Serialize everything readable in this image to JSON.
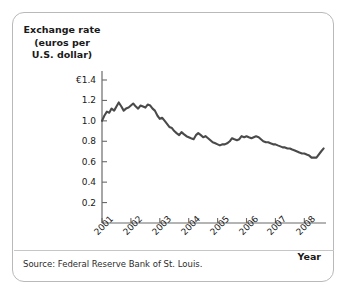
{
  "figure": {
    "source_note": "Source: Federal Reserve Bank of St. Louis.",
    "border_color": "#b9b9b9",
    "background_color": "#ffffff"
  },
  "chart_data": {
    "type": "line",
    "title": "",
    "ylabel": "Exchange rate\n(euros per\nU.S. dollar)",
    "xlabel": "Year",
    "line_color": "#4a4a4a",
    "axis_color": "#6b6b6b",
    "grid": false,
    "legend": "none",
    "xlim": [
      2001.0,
      2008.75
    ],
    "ylim": [
      0,
      1.5
    ],
    "ytick_labels": [
      "€1.4",
      "1.2",
      "1.0",
      "0.8",
      "0.6",
      "0.4",
      "0.2"
    ],
    "ytick_values": [
      1.4,
      1.2,
      1.0,
      0.8,
      0.6,
      0.4,
      0.2
    ],
    "xtick_labels": [
      "2001",
      "2002",
      "2003",
      "2004",
      "2005",
      "2006",
      "2007",
      "2008"
    ],
    "xtick_values": [
      2001,
      2002,
      2003,
      2004,
      2005,
      2006,
      2007,
      2008
    ],
    "series": [
      {
        "name": "Euros per U.S. dollar",
        "x": [
          2001.0,
          2001.08,
          2001.17,
          2001.25,
          2001.33,
          2001.42,
          2001.5,
          2001.58,
          2001.67,
          2001.75,
          2001.83,
          2001.92,
          2002.0,
          2002.08,
          2002.17,
          2002.25,
          2002.33,
          2002.42,
          2002.5,
          2002.58,
          2002.67,
          2002.75,
          2002.83,
          2002.92,
          2003.0,
          2003.08,
          2003.17,
          2003.25,
          2003.33,
          2003.42,
          2003.5,
          2003.58,
          2003.67,
          2003.75,
          2003.83,
          2003.92,
          2004.0,
          2004.08,
          2004.17,
          2004.25,
          2004.33,
          2004.42,
          2004.5,
          2004.58,
          2004.67,
          2004.75,
          2004.83,
          2004.92,
          2005.0,
          2005.08,
          2005.17,
          2005.25,
          2005.33,
          2005.42,
          2005.5,
          2005.58,
          2005.67,
          2005.75,
          2005.83,
          2005.92,
          2006.0,
          2006.08,
          2006.17,
          2006.25,
          2006.33,
          2006.42,
          2006.5,
          2006.58,
          2006.67,
          2006.75,
          2006.83,
          2006.92,
          2007.0,
          2007.08,
          2007.17,
          2007.25,
          2007.33,
          2007.42,
          2007.5,
          2007.58,
          2007.67,
          2007.75,
          2007.83,
          2007.92,
          2008.0,
          2008.08,
          2008.17,
          2008.25,
          2008.33,
          2008.42,
          2008.58,
          2008.67
        ],
        "values": [
          1.0,
          1.05,
          1.09,
          1.08,
          1.12,
          1.1,
          1.14,
          1.18,
          1.14,
          1.1,
          1.12,
          1.13,
          1.15,
          1.17,
          1.14,
          1.12,
          1.15,
          1.14,
          1.13,
          1.16,
          1.15,
          1.12,
          1.1,
          1.05,
          1.02,
          1.03,
          1.0,
          0.97,
          0.94,
          0.93,
          0.9,
          0.88,
          0.86,
          0.89,
          0.87,
          0.85,
          0.84,
          0.83,
          0.82,
          0.86,
          0.88,
          0.86,
          0.84,
          0.85,
          0.83,
          0.81,
          0.79,
          0.78,
          0.77,
          0.76,
          0.77,
          0.77,
          0.78,
          0.8,
          0.83,
          0.82,
          0.81,
          0.82,
          0.85,
          0.84,
          0.85,
          0.84,
          0.83,
          0.84,
          0.85,
          0.84,
          0.82,
          0.8,
          0.79,
          0.79,
          0.78,
          0.77,
          0.77,
          0.76,
          0.75,
          0.74,
          0.74,
          0.73,
          0.73,
          0.72,
          0.71,
          0.7,
          0.69,
          0.68,
          0.68,
          0.67,
          0.66,
          0.64,
          0.64,
          0.64,
          0.7,
          0.73
        ]
      }
    ]
  }
}
